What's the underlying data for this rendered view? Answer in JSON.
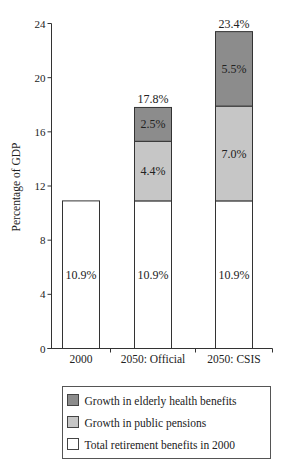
{
  "chart_data": {
    "type": "bar",
    "stacked": true,
    "title": "",
    "xlabel": "",
    "ylabel": "Percentage of GDP",
    "ylim": [
      0,
      24
    ],
    "yticks": [
      0,
      4,
      8,
      12,
      16,
      20,
      24
    ],
    "grid": false,
    "categories": [
      "2000",
      "2050: Official",
      "2050: CSIS"
    ],
    "series": [
      {
        "name": "Total retirement  benefits in 2000",
        "color": "#ffffff",
        "values": [
          10.9,
          10.9,
          10.9
        ],
        "labels": [
          "10.9%",
          "10.9%",
          "10.9%"
        ]
      },
      {
        "name": "Growth in public pensions",
        "color": "#c6c6c6",
        "values": [
          0,
          4.4,
          7.0
        ],
        "labels": [
          "",
          "4.4%",
          "7.0%"
        ]
      },
      {
        "name": "Growth in elderly health benefits",
        "color": "#8c8c8c",
        "values": [
          0,
          2.5,
          5.5
        ],
        "labels": [
          "",
          "2.5%",
          "5.5%"
        ]
      }
    ],
    "totals": [
      10.9,
      17.8,
      23.4
    ],
    "total_labels": [
      "",
      "17.8%",
      "23.4%"
    ],
    "legend": {
      "placement": "bottom",
      "order": [
        2,
        1,
        0
      ]
    }
  }
}
